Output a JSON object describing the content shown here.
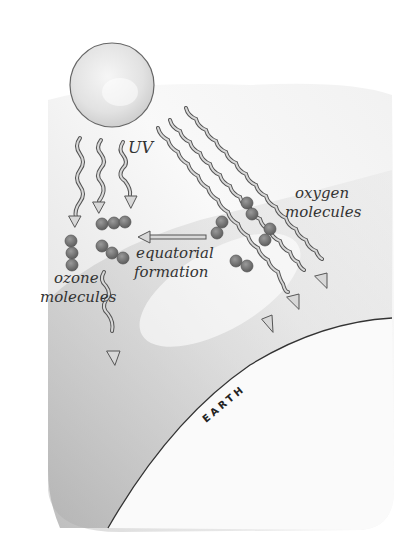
{
  "diagram": {
    "labels": {
      "uv": "UV",
      "oxygen_line1": "oxygen",
      "oxygen_line2": "molecules",
      "equatorial_line1": "equatorial",
      "equatorial_line2": "formation",
      "ozone_line1": "ozone",
      "ozone_line2": "molecules",
      "earth": "EARTH"
    },
    "elements": {
      "sun": "sun-sphere",
      "uv_rays_vertical": 4,
      "uv_rays_diagonal": 3,
      "ozone_molecules": 3,
      "oxygen_molecules": 4
    },
    "colors": {
      "molecule": "#707070",
      "ray_fill": "#d8d8d8",
      "ray_stroke": "#555555",
      "sky_shade": "#c8c8c8",
      "earth_line": "#333333",
      "background": "#ffffff"
    }
  }
}
